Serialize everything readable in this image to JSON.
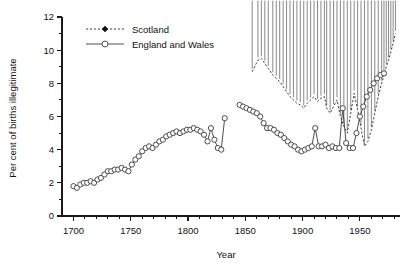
{
  "chart_data": {
    "type": "line",
    "title": "",
    "xlabel": "Year",
    "ylabel": "Per cent of births illegitimate",
    "xlim": [
      1690,
      1985
    ],
    "ylim": [
      0,
      12
    ],
    "grid": false,
    "legend_position": "top-left",
    "x_ticks_major": [
      1700,
      1750,
      1800,
      1850,
      1900,
      1950
    ],
    "x_tick_labels": [
      "1700",
      "1750",
      "1800",
      "1850",
      "1900",
      "1950"
    ],
    "x_minor_step": 10,
    "y_ticks_major": [
      0,
      2,
      4,
      6,
      8,
      10,
      12
    ],
    "y_tick_labels": [
      "0",
      "2",
      "4",
      "6",
      "8",
      "10",
      "12"
    ],
    "y_minor_step": 1,
    "series": [
      {
        "name": "Scotland",
        "marker": "filled-diamond",
        "line_style": "dashed",
        "color": "#111111",
        "points": [
          [
            1856,
            8.7
          ],
          [
            1861,
            9.4
          ],
          [
            1864,
            9.5
          ],
          [
            1867,
            9.2
          ],
          [
            1870,
            8.9
          ],
          [
            1874,
            8.5
          ],
          [
            1877,
            8.3
          ],
          [
            1880,
            8.1
          ],
          [
            1883,
            7.8
          ],
          [
            1886,
            7.5
          ],
          [
            1889,
            7.2
          ],
          [
            1892,
            7.0
          ],
          [
            1895,
            6.8
          ],
          [
            1898,
            6.7
          ],
          [
            1901,
            6.5
          ],
          [
            1904,
            6.8
          ],
          [
            1907,
            7.0
          ],
          [
            1910,
            7.2
          ],
          [
            1913,
            6.9
          ],
          [
            1916,
            7.1
          ],
          [
            1919,
            7.2
          ],
          [
            1921,
            6.5
          ],
          [
            1924,
            6.2
          ],
          [
            1927,
            6.6
          ],
          [
            1930,
            7.0
          ],
          [
            1933,
            6.0
          ],
          [
            1936,
            5.4
          ],
          [
            1939,
            5.0
          ],
          [
            1942,
            6.2
          ],
          [
            1945,
            7.4
          ],
          [
            1948,
            6.4
          ],
          [
            1951,
            5.3
          ],
          [
            1954,
            4.2
          ],
          [
            1957,
            4.5
          ],
          [
            1960,
            5.2
          ],
          [
            1963,
            6.2
          ],
          [
            1966,
            7.2
          ],
          [
            1969,
            8.0
          ],
          [
            1971,
            8.5
          ],
          [
            1973,
            9.0
          ],
          [
            1975,
            9.4
          ],
          [
            1977,
            9.9
          ],
          [
            1979,
            10.4
          ],
          [
            1981,
            11.0
          ]
        ]
      },
      {
        "name": "England and Wales",
        "marker": "open-circle",
        "line_style": "solid",
        "color": "#3a3a3a",
        "points": [
          [
            1700,
            1.8
          ],
          [
            1703,
            1.7
          ],
          [
            1706,
            1.9
          ],
          [
            1709,
            2.0
          ],
          [
            1712,
            2.0
          ],
          [
            1715,
            2.1
          ],
          [
            1718,
            2.0
          ],
          [
            1721,
            2.2
          ],
          [
            1724,
            2.3
          ],
          [
            1727,
            2.5
          ],
          [
            1730,
            2.7
          ],
          [
            1733,
            2.7
          ],
          [
            1736,
            2.8
          ],
          [
            1739,
            2.8
          ],
          [
            1742,
            2.9
          ],
          [
            1745,
            2.8
          ],
          [
            1748,
            2.7
          ],
          [
            1751,
            3.1
          ],
          [
            1754,
            3.4
          ],
          [
            1757,
            3.6
          ],
          [
            1760,
            3.9
          ],
          [
            1763,
            4.1
          ],
          [
            1766,
            4.2
          ],
          [
            1769,
            4.1
          ],
          [
            1772,
            4.3
          ],
          [
            1775,
            4.5
          ],
          [
            1778,
            4.6
          ],
          [
            1781,
            4.8
          ],
          [
            1784,
            4.9
          ],
          [
            1787,
            5.0
          ],
          [
            1790,
            5.1
          ],
          [
            1793,
            5.0
          ],
          [
            1796,
            5.1
          ],
          [
            1799,
            5.2
          ],
          [
            1802,
            5.2
          ],
          [
            1805,
            5.3
          ],
          [
            1808,
            5.2
          ],
          [
            1811,
            5.1
          ],
          [
            1814,
            4.9
          ],
          [
            1817,
            4.5
          ],
          [
            1820,
            5.3
          ],
          [
            1823,
            4.6
          ],
          [
            1826,
            4.1
          ],
          [
            1829,
            4.0
          ],
          [
            1832,
            5.9
          ],
          [
            1845,
            6.7
          ],
          [
            1848,
            6.6
          ],
          [
            1851,
            6.5
          ],
          [
            1854,
            6.4
          ],
          [
            1857,
            6.3
          ],
          [
            1860,
            6.2
          ],
          [
            1863,
            6.0
          ],
          [
            1866,
            5.6
          ],
          [
            1869,
            5.3
          ],
          [
            1872,
            5.3
          ],
          [
            1875,
            5.2
          ],
          [
            1878,
            5.0
          ],
          [
            1881,
            4.9
          ],
          [
            1884,
            4.7
          ],
          [
            1887,
            4.5
          ],
          [
            1890,
            4.3
          ],
          [
            1893,
            4.2
          ],
          [
            1896,
            4.0
          ],
          [
            1899,
            3.9
          ],
          [
            1902,
            4.0
          ],
          [
            1905,
            4.1
          ],
          [
            1908,
            4.2
          ],
          [
            1911,
            5.3
          ],
          [
            1914,
            4.2
          ],
          [
            1917,
            4.2
          ],
          [
            1920,
            4.3
          ],
          [
            1923,
            4.1
          ],
          [
            1926,
            4.2
          ],
          [
            1929,
            4.1
          ],
          [
            1932,
            4.1
          ],
          [
            1935,
            6.5
          ],
          [
            1938,
            4.4
          ],
          [
            1941,
            4.1
          ],
          [
            1944,
            4.1
          ],
          [
            1947,
            5.0
          ],
          [
            1950,
            6.0
          ],
          [
            1953,
            6.6
          ],
          [
            1956,
            7.2
          ],
          [
            1959,
            7.6
          ],
          [
            1962,
            8.0
          ],
          [
            1965,
            8.3
          ],
          [
            1968,
            8.5
          ],
          [
            1971,
            8.6
          ]
        ]
      }
    ]
  },
  "legend": {
    "entries": [
      {
        "label": "Scotland"
      },
      {
        "label": "England and Wales"
      }
    ]
  }
}
